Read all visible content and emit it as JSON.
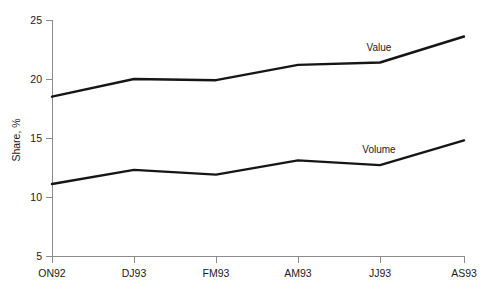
{
  "chart_data": {
    "type": "line",
    "title": "",
    "xlabel": "",
    "ylabel": "Share, %",
    "categories": [
      "ON92",
      "DJ93",
      "FM93",
      "AM93",
      "JJ93",
      "AS93"
    ],
    "ylim": [
      5,
      25
    ],
    "yticks": [
      5,
      10,
      15,
      20,
      25
    ],
    "ytick_labels": [
      "5",
      "10",
      "15",
      "20",
      "25"
    ],
    "grid": false,
    "legend_position": "inline-annotation",
    "series": [
      {
        "name": "Value",
        "label": "Value",
        "color": "#161616",
        "values": [
          18.5,
          20.0,
          19.9,
          21.2,
          21.4,
          23.6
        ],
        "label_x": "JJ93",
        "label_offset_y": -1.0
      },
      {
        "name": "Volume",
        "label": "Volume",
        "color": "#161616",
        "values": [
          11.1,
          12.3,
          11.9,
          13.1,
          12.7,
          14.8
        ],
        "label_x": "JJ93",
        "label_offset_y": 1.1
      }
    ],
    "annotations": [
      {
        "text": "Value",
        "x_px": 378,
        "y_px": 51
      },
      {
        "text": "Volume",
        "x_px": 378,
        "y_px": 153
      }
    ]
  },
  "axis": {
    "y_title": "Share, %",
    "y_tick_25": "25",
    "y_tick_20": "20",
    "y_tick_15": "15",
    "y_tick_10": "10",
    "y_tick_5": "5",
    "x_tick_0": "ON92",
    "x_tick_1": "DJ93",
    "x_tick_2": "FM93",
    "x_tick_3": "AM93",
    "x_tick_4": "JJ93",
    "x_tick_5": "AS93"
  },
  "series_labels": {
    "value": "Value",
    "volume": "Volume"
  }
}
